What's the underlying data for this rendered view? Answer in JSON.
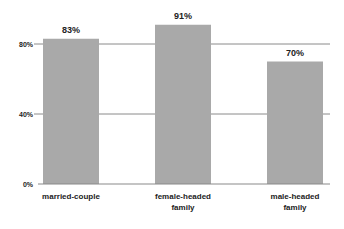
{
  "chart_data": {
    "type": "bar",
    "title": "",
    "xlabel": "",
    "ylabel": "",
    "categories": [
      [
        "married-couple"
      ],
      [
        "female-headed",
        "family"
      ],
      [
        "male-headed",
        "family"
      ]
    ],
    "values": [
      83,
      91,
      70
    ],
    "data_labels": [
      "83%",
      "91%",
      "70%"
    ],
    "ylim": [
      0,
      100
    ],
    "yticks": [
      0,
      40,
      80
    ],
    "ytick_labels": [
      "0%",
      "40%",
      "80%"
    ],
    "grid": true,
    "legend": "none",
    "colors": {
      "bar": "#a9a9a9",
      "grid": "#8a8a8a",
      "axis": "#8a8a8a",
      "text": "#222222"
    }
  }
}
